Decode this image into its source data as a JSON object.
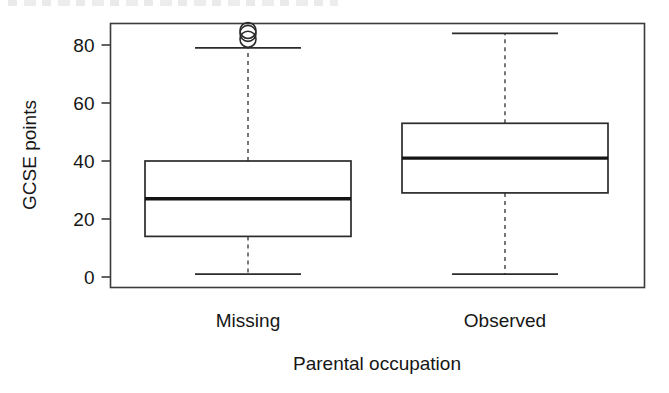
{
  "figure": {
    "background_color": "#ffffff",
    "ink_color": "#1a1a1a",
    "width": 669,
    "height": 393
  },
  "chart_data": {
    "type": "box",
    "title": "",
    "subtitle": "",
    "xlabel": "Parental occupation",
    "ylabel": "GCSE points",
    "categories": [
      "Missing",
      "Observed"
    ],
    "ylim": [
      0,
      88
    ],
    "yticks": [
      0,
      20,
      40,
      60,
      80
    ],
    "ytick_labels": [
      "0",
      "20",
      "40",
      "60",
      "80"
    ],
    "grid": false,
    "legend": "none",
    "orientation": "vertical",
    "boxes": [
      {
        "category": "Missing",
        "whisker_low": 1,
        "q1": 14,
        "median": 27,
        "q3": 40,
        "whisker_high": 79,
        "outliers": [
          82,
          84,
          85
        ]
      },
      {
        "category": "Observed",
        "whisker_low": 1,
        "q1": 29,
        "median": 41,
        "q3": 53,
        "whisker_high": 84,
        "outliers": []
      }
    ]
  }
}
